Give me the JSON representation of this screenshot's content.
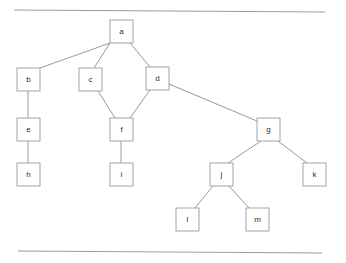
{
  "figure": {
    "type": "node-link-diagram",
    "background_color": "#ffffff",
    "node_fill": "#ffffff",
    "node_stroke": "#9a9a9a",
    "edge_stroke": "#8c8c8c",
    "rule_stroke": "#9a9a9a",
    "label_color": "#2b2b2b"
  },
  "rules": [
    {
      "name": "top-rule",
      "x1": 14,
      "y1": 10,
      "x2": 325,
      "y2": 12
    },
    {
      "name": "bottom-rule",
      "x1": 18,
      "y1": 251,
      "x2": 322,
      "y2": 253
    }
  ],
  "nodes": [
    {
      "id": "a",
      "label": "a",
      "x": 110,
      "y": 20,
      "w": 23,
      "h": 23
    },
    {
      "id": "b",
      "label": "b",
      "x": 17,
      "y": 68,
      "w": 23,
      "h": 23
    },
    {
      "id": "c",
      "label": "c",
      "x": 79,
      "y": 68,
      "w": 23,
      "h": 23
    },
    {
      "id": "d",
      "label": "d",
      "x": 146,
      "y": 67,
      "w": 23,
      "h": 23
    },
    {
      "id": "e",
      "label": "e",
      "x": 17,
      "y": 118,
      "w": 23,
      "h": 23
    },
    {
      "id": "f",
      "label": "f",
      "x": 110,
      "y": 118,
      "w": 23,
      "h": 23
    },
    {
      "id": "g",
      "label": "g",
      "x": 257,
      "y": 118,
      "w": 23,
      "h": 23
    },
    {
      "id": "h",
      "label": "h",
      "x": 17,
      "y": 163,
      "w": 23,
      "h": 23
    },
    {
      "id": "i",
      "label": "i",
      "x": 110,
      "y": 163,
      "w": 23,
      "h": 23
    },
    {
      "id": "j",
      "label": "j",
      "x": 210,
      "y": 163,
      "w": 23,
      "h": 23
    },
    {
      "id": "k",
      "label": "k",
      "x": 303,
      "y": 163,
      "w": 23,
      "h": 23
    },
    {
      "id": "l",
      "label": "l",
      "x": 176,
      "y": 208,
      "w": 23,
      "h": 23
    },
    {
      "id": "m",
      "label": "m",
      "x": 246,
      "y": 208,
      "w": 23,
      "h": 23
    }
  ],
  "edges": [
    {
      "id": "a-b",
      "from": "a",
      "to": "b",
      "x1": 110,
      "y1": 43,
      "x2": 40,
      "y2": 68
    },
    {
      "id": "a-c",
      "from": "a",
      "to": "c",
      "x1": 110,
      "y1": 43,
      "x2": 94,
      "y2": 68
    },
    {
      "id": "a-d",
      "from": "a",
      "to": "d",
      "x1": 130,
      "y1": 43,
      "x2": 150,
      "y2": 67
    },
    {
      "id": "b-e",
      "from": "b",
      "to": "e",
      "x1": 28,
      "y1": 91,
      "x2": 28,
      "y2": 118
    },
    {
      "id": "e-h",
      "from": "e",
      "to": "h",
      "x1": 28,
      "y1": 141,
      "x2": 28,
      "y2": 163
    },
    {
      "id": "c-f",
      "from": "c",
      "to": "f",
      "x1": 98,
      "y1": 91,
      "x2": 115,
      "y2": 118
    },
    {
      "id": "d-f",
      "from": "d",
      "to": "f",
      "x1": 150,
      "y1": 90,
      "x2": 130,
      "y2": 118
    },
    {
      "id": "f-i",
      "from": "f",
      "to": "i",
      "x1": 121,
      "y1": 141,
      "x2": 121,
      "y2": 163
    },
    {
      "id": "d-g",
      "from": "d",
      "to": "g",
      "x1": 169,
      "y1": 84,
      "x2": 257,
      "y2": 121
    },
    {
      "id": "g-j",
      "from": "g",
      "to": "j",
      "x1": 261,
      "y1": 141,
      "x2": 228,
      "y2": 163
    },
    {
      "id": "g-k",
      "from": "g",
      "to": "k",
      "x1": 278,
      "y1": 141,
      "x2": 307,
      "y2": 163
    },
    {
      "id": "j-l",
      "from": "j",
      "to": "l",
      "x1": 213,
      "y1": 186,
      "x2": 195,
      "y2": 208
    },
    {
      "id": "j-m",
      "from": "j",
      "to": "m",
      "x1": 229,
      "y1": 186,
      "x2": 249,
      "y2": 208
    }
  ]
}
